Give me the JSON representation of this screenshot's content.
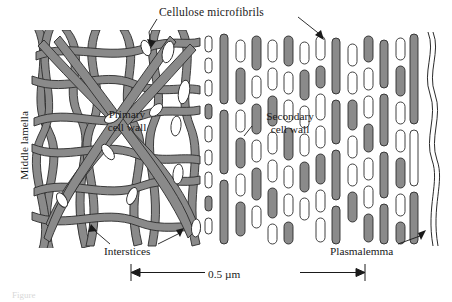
{
  "figure": {
    "title_label": "Cellulose microfibrils",
    "scale_bar_label": "0.5 µm",
    "caption_fragment": "Figure",
    "colors": {
      "microfibril_fill": "#8a8a8a",
      "outline": "#2b2b2b",
      "background": "#ffffff",
      "lumen_fill": "#ffffff"
    },
    "labels": {
      "middle_lamella": "Middle lamella",
      "primary_cell_wall_line1": "Primary",
      "primary_cell_wall_line2": "cell wall",
      "secondary_cell_wall_line1": "Secondary",
      "secondary_cell_wall_line2": "cell wall",
      "interstices": "Interstices",
      "plasmalemma": "Plasmalemma"
    },
    "regions": [
      {
        "name": "middle-lamella",
        "x_start": 30,
        "x_end": 48
      },
      {
        "name": "primary-cell-wall",
        "x_start": 48,
        "x_end": 200
      },
      {
        "name": "secondary-cell-wall",
        "x_start": 200,
        "x_end": 420
      },
      {
        "name": "plasmalemma",
        "x_start": 420,
        "x_end": 438
      }
    ],
    "scale_bar": {
      "x_left": 131,
      "x_right": 365,
      "y": 272,
      "value": 0.5,
      "unit": "µm"
    }
  }
}
